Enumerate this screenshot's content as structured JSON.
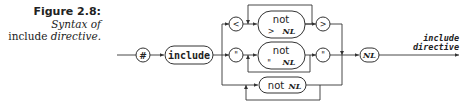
{
  "caption": {
    "title": "Figure 2.8:",
    "line1": "Syntax of",
    "line2_plain": "include",
    "line2_italic": "directive."
  },
  "diagram": {
    "type": "syntax-railroad",
    "nodes": {
      "hash": "#",
      "include": "include",
      "lt": "<",
      "gt": ">",
      "quote_open": "\"",
      "quote_close": "\"",
      "not_gt_top": "not",
      "not_gt_bottom_sym": ">",
      "not_gt_bottom_nl": "NL",
      "not_q_top": "not",
      "not_q_bottom_sym": "\"",
      "not_q_bottom_nl": "NL",
      "not_nl_word": "not",
      "not_nl_nl": "NL",
      "nl": "NL"
    },
    "output_label": {
      "line1": "include",
      "line2": "directive"
    },
    "stroke_color": "#333333"
  }
}
